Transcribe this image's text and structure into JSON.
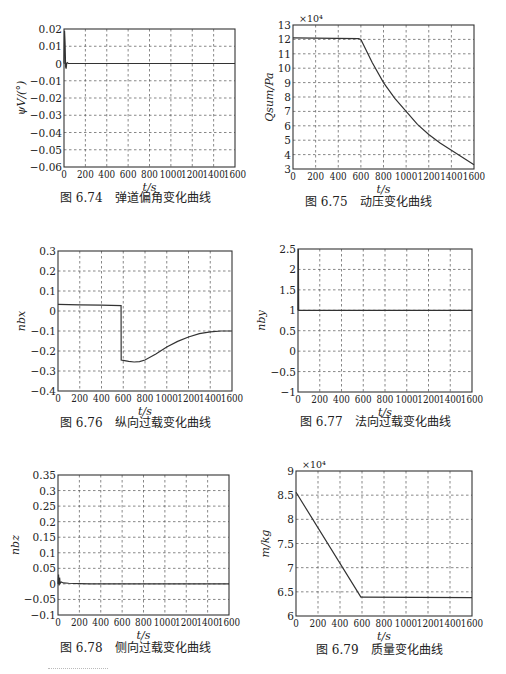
{
  "chart_data": [
    {
      "id": "fig-6-74",
      "type": "line",
      "caption": "图 6.74　弹道偏角变化曲线",
      "xlabel": "t/s",
      "ylabel": "ψV/(°)",
      "xlim": [
        0,
        1600
      ],
      "ylim": [
        -0.06,
        0.02
      ],
      "xticks": [
        0,
        200,
        400,
        600,
        800,
        1000,
        1200,
        1400,
        1600
      ],
      "yticks": [
        -0.06,
        -0.05,
        -0.04,
        -0.03,
        -0.02,
        -0.01,
        0,
        0.01,
        0.02
      ],
      "ytick_labels": [
        "−0.06",
        "−0.05",
        "−0.04",
        "−0.03",
        "−0.02",
        "−0.01",
        "0",
        "0.01",
        "0.02"
      ],
      "multiplier": "",
      "grid": true,
      "x": [
        0,
        5,
        10,
        15,
        20,
        25,
        30,
        40,
        60,
        100,
        1600
      ],
      "y": [
        0,
        0.019,
        0.012,
        -0.002,
        -0.003,
        0.0,
        0.0005,
        0,
        0,
        0,
        0
      ],
      "plot_box": {
        "left": 64,
        "top": 29,
        "right": 235,
        "bottom": 167
      },
      "caption_pos": {
        "left": 60,
        "top": 200
      }
    },
    {
      "id": "fig-6-75",
      "type": "line",
      "caption": "图 6.75　动压变化曲线",
      "xlabel": "t/s",
      "ylabel": "Qsum/Pa",
      "xlim": [
        0,
        1600
      ],
      "ylim": [
        3,
        13
      ],
      "xticks": [
        0,
        200,
        400,
        600,
        800,
        1000,
        1200,
        1400,
        1600
      ],
      "yticks": [
        3,
        4,
        5,
        6,
        7,
        8,
        9,
        10,
        11,
        12,
        13
      ],
      "ytick_labels": [
        "3",
        "4",
        "5",
        "6",
        "7",
        "8",
        "9",
        "10",
        "11",
        "12",
        "13"
      ],
      "multiplier": "×10⁴",
      "grid": true,
      "x": [
        0,
        580,
        600,
        700,
        800,
        900,
        1000,
        1100,
        1200,
        1300,
        1400,
        1500,
        1600
      ],
      "y": [
        12.1,
        12.05,
        12.0,
        10.4,
        9.0,
        7.9,
        7.0,
        6.1,
        5.4,
        4.8,
        4.3,
        3.8,
        3.3
      ],
      "plot_box": {
        "left": 293,
        "top": 25,
        "right": 474,
        "bottom": 169
      },
      "caption_pos": {
        "left": 305,
        "top": 204
      }
    },
    {
      "id": "fig-6-76",
      "type": "line",
      "caption": "图 6.76　纵向过载变化曲线",
      "xlabel": "t/s",
      "ylabel": "nbx",
      "xlim": [
        0,
        1600
      ],
      "ylim": [
        -0.4,
        0.3
      ],
      "xticks": [
        0,
        200,
        400,
        600,
        800,
        1000,
        1200,
        1400,
        1600
      ],
      "yticks": [
        -0.4,
        -0.3,
        -0.2,
        -0.1,
        0,
        0.1,
        0.2,
        0.3
      ],
      "ytick_labels": [
        "−0.4",
        "−0.3",
        "−0.2",
        "−0.1",
        "0",
        "0.1",
        "0.2",
        "0.3"
      ],
      "multiplier": "",
      "grid": true,
      "x": [
        0,
        200,
        400,
        580,
        581,
        600,
        650,
        700,
        750,
        800,
        900,
        1000,
        1100,
        1200,
        1300,
        1400,
        1500,
        1600
      ],
      "y": [
        0.033,
        0.031,
        0.029,
        0.027,
        -0.245,
        -0.247,
        -0.252,
        -0.255,
        -0.253,
        -0.245,
        -0.215,
        -0.18,
        -0.152,
        -0.13,
        -0.113,
        -0.104,
        -0.1,
        -0.1
      ],
      "plot_box": {
        "left": 58,
        "top": 251,
        "right": 232,
        "bottom": 391
      },
      "caption_pos": {
        "left": 60,
        "top": 425
      }
    },
    {
      "id": "fig-6-77",
      "type": "line",
      "caption": "图 6.77　法向过载变化曲线",
      "xlabel": "t/s",
      "ylabel": "nby",
      "xlim": [
        0,
        1600
      ],
      "ylim": [
        -1,
        2.5
      ],
      "xticks": [
        0,
        200,
        400,
        600,
        800,
        1000,
        1200,
        1400,
        1600
      ],
      "yticks": [
        -1,
        -0.5,
        0,
        0.5,
        1,
        1.5,
        2,
        2.5
      ],
      "ytick_labels": [
        "−1",
        "−0.5",
        "0",
        "0.5",
        "1",
        "1.5",
        "2",
        "2.5"
      ],
      "multiplier": "",
      "grid": true,
      "x": [
        0,
        3,
        6,
        10,
        1600
      ],
      "y": [
        1.0,
        2.5,
        1.0,
        1.0,
        1.0
      ],
      "plot_box": {
        "left": 298,
        "top": 249,
        "right": 472,
        "bottom": 392
      },
      "caption_pos": {
        "left": 300,
        "top": 424
      }
    },
    {
      "id": "fig-6-78",
      "type": "line",
      "caption": "图 6.78　侧向过载变化曲线",
      "xlabel": "t/s",
      "ylabel": "nbz",
      "xlim": [
        0,
        1600
      ],
      "ylim": [
        -0.1,
        0.35
      ],
      "xticks": [
        0,
        200,
        400,
        600,
        800,
        1000,
        1200,
        1400,
        1600
      ],
      "yticks": [
        -0.1,
        -0.05,
        0,
        0.05,
        0.1,
        0.15,
        0.2,
        0.25,
        0.3,
        0.35
      ],
      "ytick_labels": [
        "−0.1",
        "−0.05",
        "0",
        "0.05",
        "0.1",
        "0.15",
        "0.2",
        "0.25",
        "0.3",
        "0.35"
      ],
      "multiplier": "",
      "grid": true,
      "x": [
        0,
        5,
        10,
        15,
        20,
        30,
        50,
        100,
        200,
        300,
        1600
      ],
      "y": [
        0,
        0.03,
        -0.005,
        0.02,
        0.002,
        0.006,
        0.003,
        0.002,
        0.001,
        0,
        0
      ],
      "plot_box": {
        "left": 58,
        "top": 475,
        "right": 229,
        "bottom": 615
      },
      "caption_pos": {
        "left": 60,
        "top": 650
      }
    },
    {
      "id": "fig-6-79",
      "type": "line",
      "caption": "图 6.79　质量变化曲线",
      "xlabel": "t/s",
      "ylabel": "m/kg",
      "xlim": [
        0,
        1600
      ],
      "ylim": [
        6,
        9
      ],
      "xticks": [
        0,
        200,
        400,
        600,
        800,
        1000,
        1200,
        1400,
        1600
      ],
      "yticks": [
        6,
        6.5,
        7,
        7.5,
        8,
        8.5,
        9
      ],
      "ytick_labels": [
        "6",
        "6.5",
        "7",
        "7.5",
        "8",
        "8.5",
        "9"
      ],
      "multiplier": "×10⁴",
      "grid": true,
      "x": [
        0,
        590,
        600,
        1600
      ],
      "y": [
        8.56,
        6.39,
        6.39,
        6.38
      ],
      "plot_box": {
        "left": 296,
        "top": 471,
        "right": 472,
        "bottom": 616
      },
      "caption_pos": {
        "left": 316,
        "top": 652
      }
    }
  ]
}
